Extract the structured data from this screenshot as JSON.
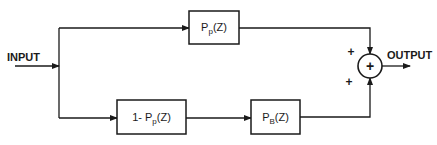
{
  "diagram": {
    "type": "block-diagram",
    "input_label": "INPUT",
    "output_label": "OUTPUT",
    "blocks": [
      {
        "id": "pp",
        "label_main": "P",
        "label_sub": "p",
        "label_tail": "(Z)"
      },
      {
        "id": "one_minus_pp",
        "label_prefix": "1- ",
        "label_main": "P",
        "label_sub": "p",
        "label_tail": "(Z)"
      },
      {
        "id": "pb",
        "label_main": "P",
        "label_sub": "B",
        "label_tail": "(Z)"
      }
    ],
    "summing_junction": {
      "symbol": "+",
      "input_signs": [
        "+",
        "+"
      ]
    },
    "connections": [
      {
        "from": "input",
        "to": "pp"
      },
      {
        "from": "input",
        "to": "one_minus_pp"
      },
      {
        "from": "one_minus_pp",
        "to": "pb"
      },
      {
        "from": "pp",
        "to": "summing_junction",
        "sign": "+"
      },
      {
        "from": "pb",
        "to": "summing_junction",
        "sign": "+"
      },
      {
        "from": "summing_junction",
        "to": "output"
      }
    ]
  }
}
